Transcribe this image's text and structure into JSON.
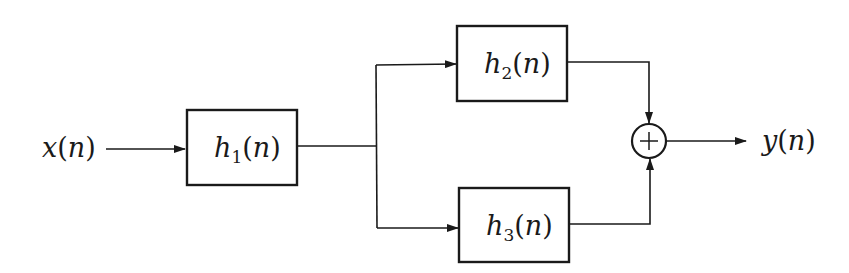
{
  "diagram": {
    "type": "block-diagram",
    "input": {
      "symbol": "x",
      "arg": "n",
      "label": "x(n)"
    },
    "output": {
      "symbol": "y",
      "arg": "n",
      "label": "y(n)"
    },
    "blocks": [
      {
        "id": "h1",
        "symbol": "h",
        "sub": "1",
        "arg": "n",
        "label": "h1(n)"
      },
      {
        "id": "h2",
        "symbol": "h",
        "sub": "2",
        "arg": "n",
        "label": "h2(n)"
      },
      {
        "id": "h3",
        "symbol": "h",
        "sub": "3",
        "arg": "n",
        "label": "h3(n)"
      }
    ],
    "summer": {
      "symbol": "+",
      "label": "adder"
    },
    "connections": [
      {
        "from": "x(n)",
        "to": "h1"
      },
      {
        "from": "h1",
        "to": "h2"
      },
      {
        "from": "h1",
        "to": "h3"
      },
      {
        "from": "h2",
        "to": "adder"
      },
      {
        "from": "h3",
        "to": "adder"
      },
      {
        "from": "adder",
        "to": "y(n)"
      }
    ],
    "colors": {
      "stroke": "#1a1a1a",
      "background": "#ffffff"
    }
  }
}
